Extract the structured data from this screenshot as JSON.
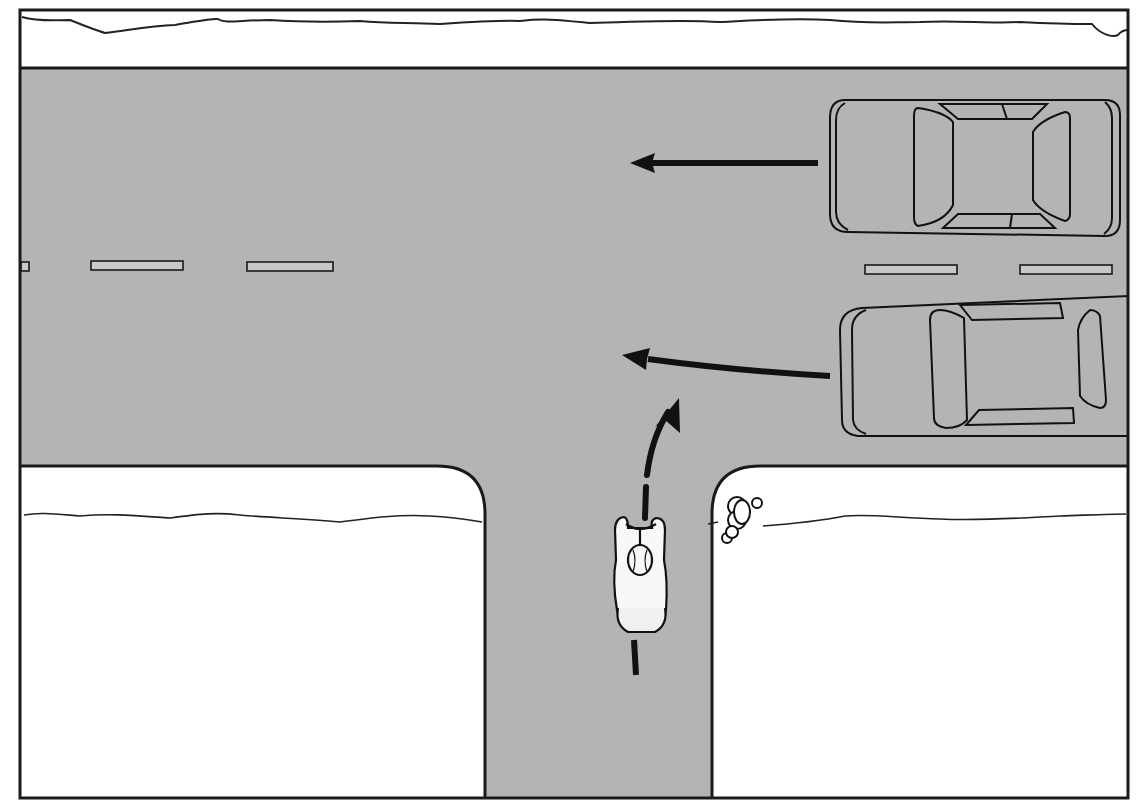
{
  "diagram": {
    "type": "traffic-scenario",
    "view": "top-down",
    "title": "",
    "colors": {
      "road": "#b4b4b4",
      "sidewalk": "#ffffff",
      "outline": "#1a1a1a",
      "arrow": "#111111",
      "lane_marking": "#c8c8c8"
    },
    "elements": {
      "main_road": {
        "orientation": "horizontal",
        "lanes": 2,
        "center_line": "dashed"
      },
      "side_road": {
        "orientation": "vertical",
        "joins": "main_road",
        "junction": "T-intersection"
      },
      "vehicles": [
        {
          "id": "car-1",
          "lane": "upper",
          "heading": "left",
          "motion": "straight"
        },
        {
          "id": "car-2",
          "lane": "lower",
          "heading": "left",
          "motion": "straight"
        }
      ],
      "cyclist": {
        "location": "side-road",
        "heading": "up",
        "motion": "turning-right-into-main-road"
      },
      "pedestrian": {
        "location": "right-corner-sidewalk"
      }
    }
  }
}
